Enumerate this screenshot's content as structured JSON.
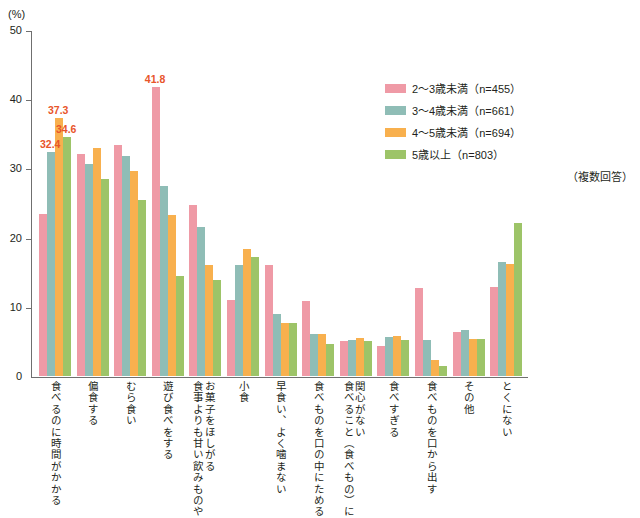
{
  "chart_data": {
    "type": "bar",
    "title": "",
    "subtitle": "",
    "unit_label": "(%)",
    "xlabel": "",
    "ylabel": "",
    "ylim": [
      0,
      50
    ],
    "yticks": [
      50,
      40,
      30,
      20,
      10,
      0
    ],
    "grid": false,
    "legend_position": "right",
    "note": "（複数回答）",
    "categories": [
      "食べるのに時間がかかる",
      "偏食する",
      "むら食い",
      "遊び食べをする",
      "食事よりも甘い飲みものやお菓子をほしがる",
      "小食",
      "早食い、よく噛まない",
      "食べものを口の中にためる",
      "食べること（食べもの）に関心がない",
      "食べすぎる",
      "食べものを口から出す",
      "その他",
      "とくにない"
    ],
    "category_lines": [
      [
        "食べるのに時間がかかる"
      ],
      [
        "偏食する"
      ],
      [
        "むら食い"
      ],
      [
        "遊び食べをする"
      ],
      [
        "食事よりも甘い飲みものや",
        "お菓子をほしがる"
      ],
      [
        "小食"
      ],
      [
        "早食い、よく噛まない"
      ],
      [
        "食べものを口の中にためる"
      ],
      [
        "食べること（食べもの）に",
        "関心がない"
      ],
      [
        "食べすぎる"
      ],
      [
        "食べものを口から出す"
      ],
      [
        "その他"
      ],
      [
        "とくにない"
      ]
    ],
    "series": [
      {
        "name": "2〜3歳未満（n=455）",
        "color": "#ef9aa6",
        "values": [
          23.4,
          32.1,
          33.4,
          41.8,
          24.7,
          11.0,
          16.1,
          10.9,
          5.0,
          4.4,
          12.7,
          6.4,
          12.8
        ]
      },
      {
        "name": "3〜4歳未満（n=661）",
        "color": "#8fbdb6",
        "values": [
          32.4,
          30.7,
          31.8,
          27.4,
          21.6,
          16.1,
          8.9,
          6.1,
          5.2,
          5.6,
          5.2,
          6.7,
          16.5
        ]
      },
      {
        "name": "4〜5歳未満（n=694）",
        "color": "#f8b04e",
        "values": [
          37.3,
          33.0,
          29.6,
          23.2,
          16.0,
          18.3,
          7.6,
          6.0,
          5.5,
          5.8,
          2.3,
          5.3,
          16.2
        ]
      },
      {
        "name": "5歳以上（n=803）",
        "color": "#9dc468",
        "values": [
          34.6,
          28.4,
          25.5,
          14.4,
          13.9,
          17.2,
          7.6,
          4.6,
          5.1,
          5.2,
          1.4,
          5.3,
          22.1
        ]
      }
    ],
    "value_labels": [
      {
        "text": "32.4",
        "group": 0,
        "series": 1,
        "color": "#e8552b"
      },
      {
        "text": "37.3",
        "group": 0,
        "series": 2,
        "color": "#e8552b"
      },
      {
        "text": "34.6",
        "group": 0,
        "series": 3,
        "color": "#e8552b"
      },
      {
        "text": "41.8",
        "group": 3,
        "series": 0,
        "color": "#e8552b"
      }
    ]
  },
  "legend": {
    "items": [
      {
        "label": "2〜3歳未満（n=455）"
      },
      {
        "label": "3〜4歳未満（n=661）"
      },
      {
        "label": "4〜5歳未満（n=694）"
      },
      {
        "label": "5歳以上（n=803）"
      }
    ],
    "note": "（複数回答）"
  },
  "axis": {
    "unit": "(%)",
    "y_tick_labels": [
      "50",
      "40",
      "30",
      "20",
      "10",
      "0"
    ]
  }
}
